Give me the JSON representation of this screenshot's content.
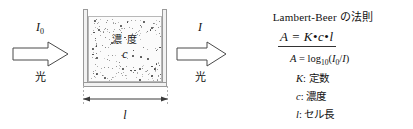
{
  "diagram": {
    "incident_beam": {
      "symbol": "I",
      "subscript": "0",
      "caption": "光",
      "arrow_icon": "right-block-arrow-icon"
    },
    "transmitted_beam": {
      "symbol": "I",
      "subscript": "",
      "caption": "光",
      "arrow_icon": "right-block-arrow-icon"
    },
    "cuvette": {
      "concentration_label": "濃 度",
      "concentration_symbol": "c",
      "speckle_icon": "particle-speckle-icon"
    },
    "dimension": {
      "label": "l",
      "icon": "double-headed-arrow-icon"
    }
  },
  "formula": {
    "law_title": "Lambert-Beer の法則",
    "main_equation": {
      "lhs": "A",
      "equals": "=",
      "term1": "K",
      "dot1": "•",
      "term2": "c",
      "dot2": "•",
      "term3": "l"
    },
    "absorbance_definition": {
      "lhs": "A",
      "equals": "=",
      "func": "log",
      "base": "10",
      "open": "(",
      "num": "I",
      "num_sub": "0",
      "slash": "/",
      "den": "I",
      "close": ")"
    },
    "definitions": [
      {
        "symbol": "K",
        "sep": ":",
        "meaning": "定数"
      },
      {
        "symbol": "c",
        "sep": ":",
        "meaning": "濃度"
      },
      {
        "symbol": "l",
        "sep": ":",
        "meaning": "セル長"
      }
    ]
  },
  "colors": {
    "ink": "#111111",
    "wall": "#f2f2f2",
    "wall_stroke": "#9a9a9a",
    "liquid": "#fbfbfb",
    "speck": "#2b2b2b",
    "arrow_stroke": "#4a4a4a",
    "dim_line": "#3a3a3a",
    "background": "#ffffff"
  }
}
